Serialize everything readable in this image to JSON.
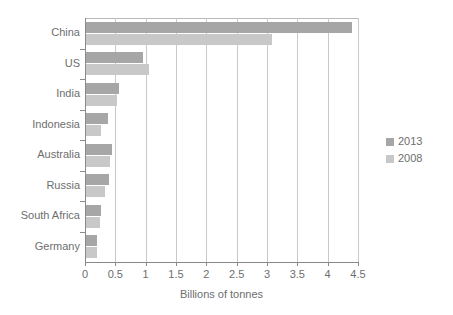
{
  "chart_data": {
    "type": "bar",
    "orientation": "horizontal",
    "title": "",
    "xlabel": "Billions of tonnes",
    "ylabel": "",
    "xlim": [
      0,
      4.5
    ],
    "xticks": [
      "0",
      "0.5",
      "1",
      "1.5",
      "2",
      "2.5",
      "3",
      "3.5",
      "4",
      "4.5"
    ],
    "xtick_values": [
      0,
      0.5,
      1,
      1.5,
      2,
      2.5,
      3,
      3.5,
      4,
      4.5
    ],
    "grid": "vertical",
    "legend_position": "right",
    "categories": [
      "China",
      "US",
      "India",
      "Indonesia",
      "Australia",
      "Russia",
      "South Africa",
      "Germany"
    ],
    "series": [
      {
        "name": "2013",
        "color": "#a6a6a6",
        "values": [
          4.4,
          0.96,
          0.56,
          0.38,
          0.45,
          0.39,
          0.26,
          0.19
        ]
      },
      {
        "name": "2008",
        "color": "#c8c8c8",
        "values": [
          3.08,
          1.06,
          0.52,
          0.26,
          0.41,
          0.33,
          0.25,
          0.19
        ]
      }
    ]
  },
  "legend": {
    "items": [
      {
        "label": "2013",
        "color": "#a6a6a6"
      },
      {
        "label": "2008",
        "color": "#c8c8c8"
      }
    ]
  },
  "axis": {
    "x_title": "Billions of tonnes"
  },
  "colors": {
    "series_2013": "#a6a6a6",
    "series_2008": "#c8c8c8",
    "gridline": "#c9c9c9",
    "axis": "#8a8a8a",
    "text": "#6e6e6e",
    "background": "#ffffff"
  }
}
